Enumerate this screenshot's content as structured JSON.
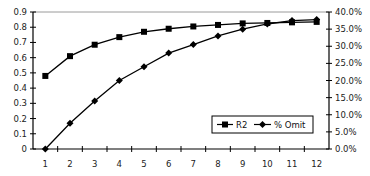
{
  "chart_data": {
    "type": "line",
    "title": "",
    "xlabel": "",
    "ylabel": "",
    "y2label": "",
    "x": [
      1,
      2,
      3,
      4,
      5,
      6,
      7,
      8,
      9,
      10,
      11,
      12
    ],
    "categories": [
      "1",
      "2",
      "3",
      "4",
      "5",
      "6",
      "7",
      "8",
      "9",
      "10",
      "11",
      "12"
    ],
    "ylim": [
      0,
      0.9
    ],
    "y2lim": [
      0,
      40
    ],
    "yticks": [
      "0",
      "0.1",
      "0.2",
      "0.3",
      "0.4",
      "0.5",
      "0.6",
      "0.7",
      "0.8",
      "0.9"
    ],
    "y2ticks": [
      "0.0%",
      "5.0%",
      "10.0%",
      "15.0%",
      "20.0%",
      "25.0%",
      "30.0%",
      "35.0%",
      "40.0%"
    ],
    "grid": false,
    "legend_position": "inside-lower-right",
    "series": [
      {
        "name": "R2",
        "axis": "left",
        "marker": "square",
        "values": [
          0.48,
          0.61,
          0.685,
          0.735,
          0.77,
          0.79,
          0.805,
          0.815,
          0.825,
          0.828,
          0.832,
          0.835
        ]
      },
      {
        "name": "% Omit",
        "axis": "right",
        "marker": "diamond",
        "values": [
          0,
          7.5,
          14,
          20,
          24,
          28,
          30.5,
          33,
          35,
          36.5,
          37.5,
          37.8
        ]
      }
    ]
  },
  "legend": {
    "items": [
      "R2",
      "% Omit"
    ]
  },
  "colors": {
    "line": "#000000",
    "frame_top": "#9a9a9a",
    "axis": "#000000"
  }
}
